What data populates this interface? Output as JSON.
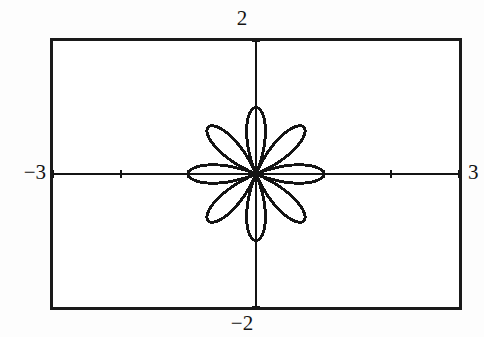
{
  "screen": {
    "kind": "graphing-calculator-screen",
    "background_color": "#ffffff",
    "border_color": "#1a1a1a",
    "curve_color": "#141414"
  },
  "labels": {
    "y_max": "2",
    "y_min": "−2",
    "x_min": "−3",
    "x_max": "3"
  },
  "chart_data": {
    "type": "line",
    "title": "",
    "subtitle": "",
    "xlabel": "",
    "ylabel": "",
    "plot_style": "polar",
    "grid": false,
    "legend": false,
    "legend_position": "none",
    "axes_visible": true,
    "axis_tick_marks": true,
    "xlim": [
      -3,
      3
    ],
    "ylim": [
      -2,
      2
    ],
    "xtick_labels": [
      "−3",
      "3"
    ],
    "ytick_labels": [
      "−2",
      "2"
    ],
    "xtick_spacing": 1,
    "ytick_spacing": 1,
    "xticks": [
      -3,
      -2,
      -1,
      0,
      1,
      2,
      3
    ],
    "yticks": [
      -2,
      -1,
      0,
      1,
      2
    ],
    "series": [
      {
        "name": "r = cos(4θ)",
        "equation_polar": "r = cos(4*theta)",
        "petal_count": 8,
        "petal_max_radius": 1.0,
        "petal_angles_deg": [
          0,
          45,
          90,
          135,
          180,
          225,
          270,
          315
        ],
        "color": "#141414",
        "theta_min_deg": 0,
        "theta_max_deg": 360,
        "theta_step_deg": 2
      }
    ],
    "annotations": [
      {
        "text": "2",
        "position": "top-outside-center"
      },
      {
        "text": "−2",
        "position": "bottom-outside-center"
      },
      {
        "text": "−3",
        "position": "left-outside-middle"
      },
      {
        "text": "3",
        "position": "right-outside-middle"
      }
    ]
  }
}
